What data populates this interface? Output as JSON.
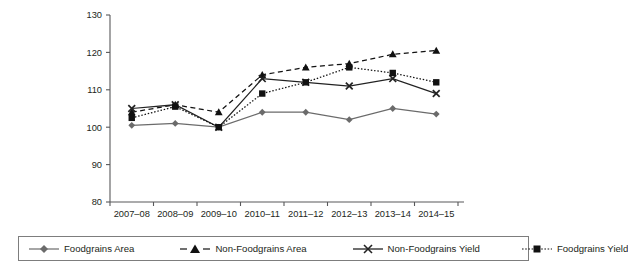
{
  "chart_data": {
    "type": "line",
    "title": "",
    "subtitle": "",
    "xlabel": "",
    "ylabel": "",
    "ylim": [
      80,
      130
    ],
    "ytick_labels": [
      "130",
      "120",
      "110",
      "100",
      "90",
      "80"
    ],
    "ytick_values": [
      130,
      120,
      110,
      100,
      90,
      80
    ],
    "grid": false,
    "legend_position": "bottom",
    "categories": [
      "2007–08",
      "2008–09",
      "2009–10",
      "2010–11",
      "2011–12",
      "2012–13",
      "2013–14",
      "2014–15"
    ],
    "series": [
      {
        "name": "Foodgrains Area",
        "marker": "diamond",
        "line_style": "solid",
        "color": "#6b6b6b",
        "values": [
          100.5,
          101.0,
          100.0,
          104.0,
          104.0,
          102.0,
          105.0,
          103.5
        ]
      },
      {
        "name": "Non-Foodgrains Area",
        "marker": "triangle",
        "line_style": "dashed",
        "color": "#111111",
        "values": [
          104.0,
          106.0,
          104.0,
          114.0,
          116.0,
          117.0,
          119.5,
          120.5
        ]
      },
      {
        "name": "Non-Foodgrains Yield",
        "marker": "cross",
        "line_style": "solid",
        "color": "#222222",
        "values": [
          105.0,
          106.0,
          100.0,
          113.0,
          112.0,
          111.0,
          113.0,
          109.0
        ]
      },
      {
        "name": "Foodgrains Yield",
        "marker": "square",
        "line_style": "dotted",
        "color": "#111111",
        "values": [
          102.5,
          105.5,
          100.0,
          109.0,
          112.0,
          116.0,
          114.5,
          112.0
        ]
      }
    ]
  },
  "legend": {
    "items": [
      {
        "label": "Foodgrains Area"
      },
      {
        "label": "Non-Foodgrains Area"
      },
      {
        "label": "Non-Foodgrains Yield"
      },
      {
        "label": "Foodgrains Yield"
      }
    ]
  }
}
